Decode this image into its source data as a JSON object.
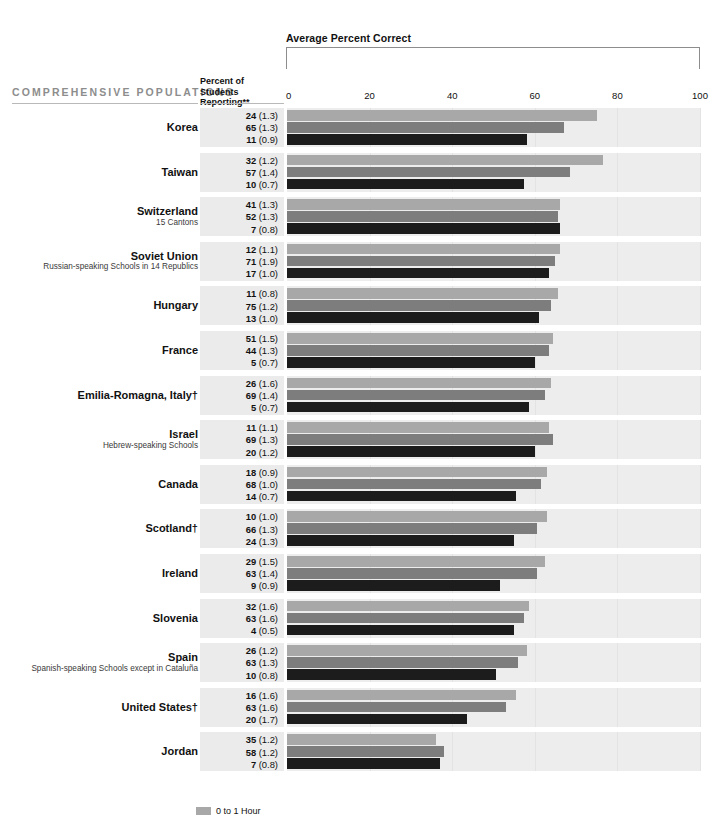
{
  "header": {
    "axis_title": "Average Percent Correct",
    "population_header": "COMPREHENSIVE POPULATIONS",
    "percent_header_line1": "Percent of",
    "percent_header_line2": "Students Reporting**"
  },
  "legend": [
    {
      "label": "0 to 1 Hour",
      "color": "#a8a8a8"
    }
  ],
  "colors": {
    "series0": "#a8a8a8",
    "series1": "#7d7d7d",
    "series2": "#1c1c1c",
    "band": "#ededed",
    "pct_band": "#ebebeb",
    "header_gray": "#8d8d8d"
  },
  "chart_data": {
    "type": "bar",
    "title": "Average Percent Correct",
    "xlabel": "Average Percent Correct",
    "ylabel": "",
    "xlim": [
      0,
      100
    ],
    "ticks": [
      0,
      20,
      40,
      60,
      80,
      100
    ],
    "grid": true,
    "orientation": "horizontal",
    "legend_position": "bottom",
    "series": [
      {
        "name": "0 to 1 Hour",
        "color": "#a8a8a8"
      },
      {
        "name": "series-2",
        "color": "#7d7d7d"
      },
      {
        "name": "series-3",
        "color": "#1c1c1c"
      }
    ],
    "categories": [
      "Korea",
      "Taiwan",
      "Switzerland",
      "Soviet Union",
      "Hungary",
      "France",
      "Emilia-Romagna, Italy†",
      "Israel",
      "Canada",
      "Scotland†",
      "Ireland",
      "Slovenia",
      "Spain",
      "United States†",
      "Jordan"
    ],
    "rows": [
      {
        "country": "Korea",
        "note": "",
        "reporting": [
          {
            "value": "24",
            "se": "(1.3)"
          },
          {
            "value": "65",
            "se": "(1.3)"
          },
          {
            "value": "11",
            "se": "(0.9)"
          }
        ],
        "percent_correct": [
          75.0,
          67.0,
          58.0
        ]
      },
      {
        "country": "Taiwan",
        "note": "",
        "reporting": [
          {
            "value": "32",
            "se": "(1.2)"
          },
          {
            "value": "57",
            "se": "(1.4)"
          },
          {
            "value": "10",
            "se": "(0.7)"
          }
        ],
        "percent_correct": [
          76.5,
          68.5,
          57.5
        ]
      },
      {
        "country": "Switzerland",
        "note": "15 Cantons",
        "reporting": [
          {
            "value": "41",
            "se": "(1.3)"
          },
          {
            "value": "52",
            "se": "(1.3)"
          },
          {
            "value": "7",
            "se": "(0.8)"
          }
        ],
        "percent_correct": [
          66.0,
          65.5,
          66.0
        ]
      },
      {
        "country": "Soviet Union",
        "note": "Russian-speaking Schools in 14 Republics",
        "reporting": [
          {
            "value": "12",
            "se": "(1.1)"
          },
          {
            "value": "71",
            "se": "(1.9)"
          },
          {
            "value": "17",
            "se": "(1.0)"
          }
        ],
        "percent_correct": [
          66.0,
          65.0,
          63.5
        ]
      },
      {
        "country": "Hungary",
        "note": "",
        "reporting": [
          {
            "value": "11",
            "se": "(0.8)"
          },
          {
            "value": "75",
            "se": "(1.2)"
          },
          {
            "value": "13",
            "se": "(1.0)"
          }
        ],
        "percent_correct": [
          65.5,
          64.0,
          61.0
        ]
      },
      {
        "country": "France",
        "note": "",
        "reporting": [
          {
            "value": "51",
            "se": "(1.5)"
          },
          {
            "value": "44",
            "se": "(1.3)"
          },
          {
            "value": "5",
            "se": "(0.7)"
          }
        ],
        "percent_correct": [
          64.5,
          63.5,
          60.0
        ]
      },
      {
        "country": "Emilia-Romagna, Italy†",
        "note": "",
        "reporting": [
          {
            "value": "26",
            "se": "(1.6)"
          },
          {
            "value": "69",
            "se": "(1.4)"
          },
          {
            "value": "5",
            "se": "(0.7)"
          }
        ],
        "percent_correct": [
          64.0,
          62.5,
          58.5
        ]
      },
      {
        "country": "Israel",
        "note": "Hebrew-speaking Schools",
        "reporting": [
          {
            "value": "11",
            "se": "(1.1)"
          },
          {
            "value": "69",
            "se": "(1.3)"
          },
          {
            "value": "20",
            "se": "(1.2)"
          }
        ],
        "percent_correct": [
          63.5,
          64.5,
          60.0
        ]
      },
      {
        "country": "Canada",
        "note": "",
        "reporting": [
          {
            "value": "18",
            "se": "(0.9)"
          },
          {
            "value": "68",
            "se": "(1.0)"
          },
          {
            "value": "14",
            "se": "(0.7)"
          }
        ],
        "percent_correct": [
          63.0,
          61.5,
          55.5
        ]
      },
      {
        "country": "Scotland†",
        "note": "",
        "reporting": [
          {
            "value": "10",
            "se": "(1.0)"
          },
          {
            "value": "66",
            "se": "(1.3)"
          },
          {
            "value": "24",
            "se": "(1.3)"
          }
        ],
        "percent_correct": [
          63.0,
          60.5,
          55.0
        ]
      },
      {
        "country": "Ireland",
        "note": "",
        "reporting": [
          {
            "value": "29",
            "se": "(1.5)"
          },
          {
            "value": "63",
            "se": "(1.4)"
          },
          {
            "value": "9",
            "se": "(0.9)"
          }
        ],
        "percent_correct": [
          62.5,
          60.5,
          51.5
        ]
      },
      {
        "country": "Slovenia",
        "note": "",
        "reporting": [
          {
            "value": "32",
            "se": "(1.6)"
          },
          {
            "value": "63",
            "se": "(1.6)"
          },
          {
            "value": "4",
            "se": "(0.5)"
          }
        ],
        "percent_correct": [
          58.5,
          57.5,
          55.0
        ]
      },
      {
        "country": "Spain",
        "note": "Spanish-speaking Schools except in Cataluña",
        "reporting": [
          {
            "value": "26",
            "se": "(1.2)"
          },
          {
            "value": "63",
            "se": "(1.3)"
          },
          {
            "value": "10",
            "se": "(0.8)"
          }
        ],
        "percent_correct": [
          58.0,
          56.0,
          50.5
        ]
      },
      {
        "country": "United States†",
        "note": "",
        "reporting": [
          {
            "value": "16",
            "se": "(1.6)"
          },
          {
            "value": "63",
            "se": "(1.6)"
          },
          {
            "value": "20",
            "se": "(1.7)"
          }
        ],
        "percent_correct": [
          55.5,
          53.0,
          43.5
        ]
      },
      {
        "country": "Jordan",
        "note": "",
        "reporting": [
          {
            "value": "35",
            "se": "(1.2)"
          },
          {
            "value": "58",
            "se": "(1.2)"
          },
          {
            "value": "7",
            "se": "(0.8)"
          }
        ],
        "percent_correct": [
          36.0,
          38.0,
          37.0
        ]
      }
    ]
  }
}
